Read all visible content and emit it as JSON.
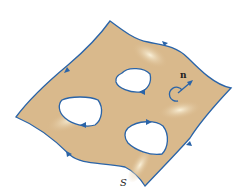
{
  "diagram": {
    "labels": {
      "normal": "n",
      "surface": "S"
    },
    "colors": {
      "surface": "#d9b98c",
      "highlight": "#f3e6c8",
      "boundary": "#2a64a8",
      "normal": "#2a64a8"
    }
  }
}
